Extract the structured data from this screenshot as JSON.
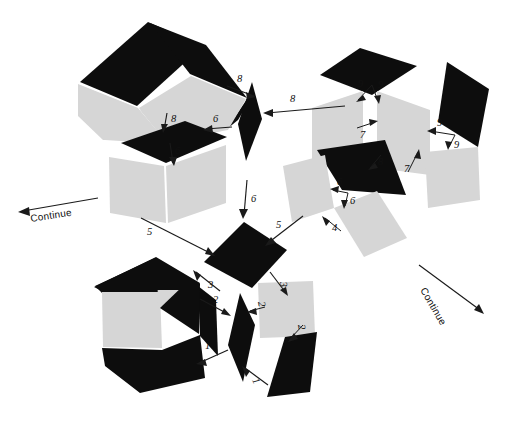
{
  "figure": {
    "background_color": "#ffffff",
    "dark_face_color": "#0d0d0d",
    "light_face_color": "#d6d6d6",
    "line_color": "#1a1a1a"
  },
  "continue_markers": [
    {
      "id": "continue-left",
      "label": "Continue"
    },
    {
      "id": "continue-right",
      "label": "Continue"
    }
  ],
  "step_labels": [
    {
      "id": "n-8-a",
      "value": "8"
    },
    {
      "id": "n-8-b",
      "value": "8"
    },
    {
      "id": "n-8-c",
      "value": "8"
    },
    {
      "id": "n-8-d",
      "value": "8"
    },
    {
      "id": "n-9-a",
      "value": "9"
    },
    {
      "id": "n-9-b",
      "value": "9"
    },
    {
      "id": "n-9-c",
      "value": "9"
    },
    {
      "id": "n-9-d",
      "value": "9"
    },
    {
      "id": "n-7-a",
      "value": "7"
    },
    {
      "id": "n-7-b",
      "value": "7"
    },
    {
      "id": "n-6-a",
      "value": "6"
    },
    {
      "id": "n-6-b",
      "value": "6"
    },
    {
      "id": "n-6-c",
      "value": "6"
    },
    {
      "id": "n-6-d",
      "value": "6"
    },
    {
      "id": "n-6-e",
      "value": "6"
    },
    {
      "id": "n-5-a",
      "value": "5"
    },
    {
      "id": "n-5-b",
      "value": "5"
    },
    {
      "id": "n-4-a",
      "value": "4"
    },
    {
      "id": "n-3-a",
      "value": "3"
    },
    {
      "id": "n-3-b",
      "value": "3"
    },
    {
      "id": "n-2-a",
      "value": "2"
    },
    {
      "id": "n-2-b",
      "value": "2"
    },
    {
      "id": "n-2-c",
      "value": "2"
    },
    {
      "id": "n-1-a",
      "value": "1"
    },
    {
      "id": "n-1-b",
      "value": "1"
    }
  ]
}
